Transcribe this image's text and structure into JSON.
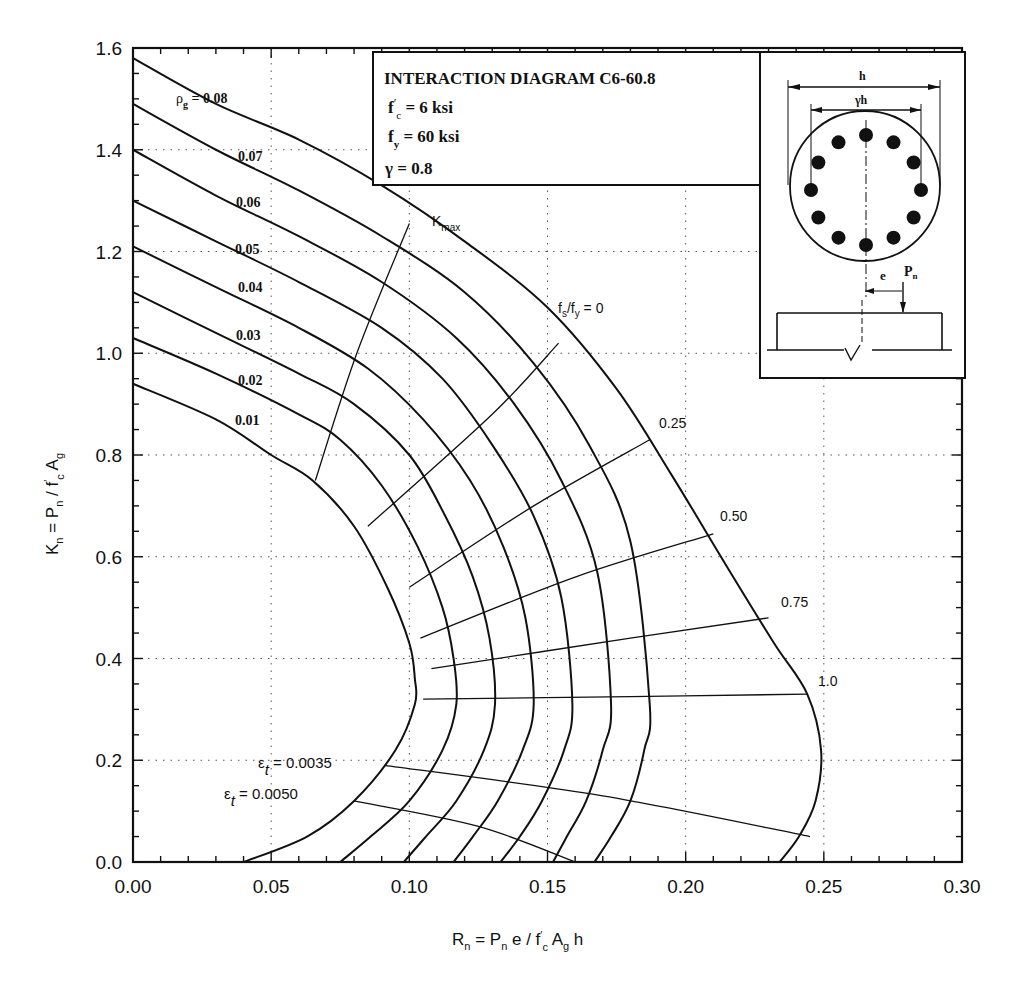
{
  "chart_data": {
    "type": "line",
    "title": "INTERACTION DIAGRAM C6-60.8",
    "parameters": [
      {
        "symbol": "f'c",
        "value": "6 ksi"
      },
      {
        "symbol": "fy",
        "value": "60 ksi"
      },
      {
        "symbol": "γ",
        "value": "0.8"
      }
    ],
    "xlabel": "Rn = Pn e / f'c Ag h",
    "ylabel": "Kn = Pn / f'c Ag",
    "xlim": [
      0.0,
      0.3
    ],
    "ylim": [
      0.0,
      1.6
    ],
    "xticks": [
      "0.00",
      "0.05",
      "0.10",
      "0.15",
      "0.20",
      "0.25",
      "0.30"
    ],
    "yticks": [
      "0.0",
      "0.2",
      "0.4",
      "0.6",
      "0.8",
      "1.0",
      "1.2",
      "1.4",
      "1.6"
    ],
    "grid": "dotted",
    "series": [
      {
        "name": "ρg = 0.01",
        "label": "0.01",
        "points": [
          [
            0.0,
            0.94
          ],
          [
            0.03,
            0.87
          ],
          [
            0.05,
            0.8
          ],
          [
            0.065,
            0.75
          ],
          [
            0.08,
            0.66
          ],
          [
            0.092,
            0.54
          ],
          [
            0.1,
            0.43
          ],
          [
            0.102,
            0.36
          ],
          [
            0.102,
            0.31
          ],
          [
            0.095,
            0.22
          ],
          [
            0.08,
            0.12
          ],
          [
            0.063,
            0.05
          ],
          [
            0.04,
            0.0
          ]
        ]
      },
      {
        "name": "ρg = 0.02",
        "label": "0.02",
        "points": [
          [
            0.0,
            1.03
          ],
          [
            0.03,
            0.96
          ],
          [
            0.06,
            0.88
          ],
          [
            0.075,
            0.83
          ],
          [
            0.09,
            0.74
          ],
          [
            0.103,
            0.62
          ],
          [
            0.112,
            0.5
          ],
          [
            0.116,
            0.4
          ],
          [
            0.117,
            0.31
          ],
          [
            0.112,
            0.22
          ],
          [
            0.1,
            0.12
          ],
          [
            0.086,
            0.05
          ],
          [
            0.075,
            0.0
          ]
        ]
      },
      {
        "name": "ρg = 0.03",
        "label": "0.03",
        "points": [
          [
            0.0,
            1.12
          ],
          [
            0.03,
            1.04
          ],
          [
            0.06,
            0.96
          ],
          [
            0.08,
            0.9
          ],
          [
            0.1,
            0.8
          ],
          [
            0.113,
            0.68
          ],
          [
            0.123,
            0.56
          ],
          [
            0.129,
            0.44
          ],
          [
            0.131,
            0.31
          ],
          [
            0.127,
            0.22
          ],
          [
            0.117,
            0.12
          ],
          [
            0.106,
            0.05
          ],
          [
            0.098,
            0.0
          ]
        ]
      },
      {
        "name": "ρg = 0.04",
        "label": "0.04",
        "points": [
          [
            0.0,
            1.21
          ],
          [
            0.03,
            1.13
          ],
          [
            0.06,
            1.05
          ],
          [
            0.085,
            0.97
          ],
          [
            0.105,
            0.87
          ],
          [
            0.122,
            0.75
          ],
          [
            0.134,
            0.62
          ],
          [
            0.142,
            0.48
          ],
          [
            0.145,
            0.31
          ],
          [
            0.141,
            0.22
          ],
          [
            0.132,
            0.12
          ],
          [
            0.123,
            0.05
          ],
          [
            0.116,
            0.0
          ]
        ]
      },
      {
        "name": "ρg = 0.05",
        "label": "0.05",
        "points": [
          [
            0.0,
            1.3
          ],
          [
            0.03,
            1.22
          ],
          [
            0.06,
            1.14
          ],
          [
            0.09,
            1.05
          ],
          [
            0.112,
            0.95
          ],
          [
            0.13,
            0.82
          ],
          [
            0.145,
            0.68
          ],
          [
            0.155,
            0.52
          ],
          [
            0.159,
            0.31
          ],
          [
            0.156,
            0.22
          ],
          [
            0.148,
            0.12
          ],
          [
            0.14,
            0.05
          ],
          [
            0.133,
            0.0
          ]
        ]
      },
      {
        "name": "ρg = 0.06",
        "label": "0.06",
        "points": [
          [
            0.0,
            1.4
          ],
          [
            0.03,
            1.31
          ],
          [
            0.06,
            1.23
          ],
          [
            0.09,
            1.14
          ],
          [
            0.117,
            1.03
          ],
          [
            0.138,
            0.9
          ],
          [
            0.155,
            0.75
          ],
          [
            0.168,
            0.57
          ],
          [
            0.173,
            0.31
          ],
          [
            0.17,
            0.22
          ],
          [
            0.164,
            0.12
          ],
          [
            0.157,
            0.05
          ],
          [
            0.152,
            0.0
          ]
        ]
      },
      {
        "name": "ρg = 0.07",
        "label": "0.07",
        "points": [
          [
            0.0,
            1.49
          ],
          [
            0.03,
            1.4
          ],
          [
            0.06,
            1.32
          ],
          [
            0.09,
            1.23
          ],
          [
            0.12,
            1.12
          ],
          [
            0.145,
            0.98
          ],
          [
            0.165,
            0.82
          ],
          [
            0.18,
            0.63
          ],
          [
            0.187,
            0.31
          ],
          [
            0.185,
            0.22
          ],
          [
            0.18,
            0.12
          ],
          [
            0.173,
            0.05
          ],
          [
            0.167,
            0.0
          ]
        ]
      },
      {
        "name": "ρg = 0.08",
        "label": "ρg = 0.08",
        "points": [
          [
            0.0,
            1.58
          ],
          [
            0.03,
            1.49
          ],
          [
            0.06,
            1.42
          ],
          [
            0.09,
            1.33
          ],
          [
            0.12,
            1.22
          ],
          [
            0.15,
            1.09
          ],
          [
            0.175,
            0.93
          ],
          [
            0.195,
            0.76
          ],
          [
            0.215,
            0.58
          ],
          [
            0.232,
            0.43
          ],
          [
            0.244,
            0.33
          ],
          [
            0.249,
            0.22
          ],
          [
            0.247,
            0.12
          ],
          [
            0.241,
            0.05
          ],
          [
            0.234,
            0.0
          ]
        ]
      }
    ],
    "fs_fy_lines": [
      {
        "label": "Kmax",
        "points": [
          [
            0.066,
            0.75
          ],
          [
            0.081,
            1.0
          ],
          [
            0.1,
            1.255
          ]
        ]
      },
      {
        "label": "fs/fy = 0",
        "points": [
          [
            0.085,
            0.66
          ],
          [
            0.13,
            0.88
          ],
          [
            0.154,
            1.02
          ]
        ]
      },
      {
        "label": "0.25",
        "points": [
          [
            0.1,
            0.54
          ],
          [
            0.145,
            0.7
          ],
          [
            0.187,
            0.83
          ]
        ]
      },
      {
        "label": "0.50",
        "points": [
          [
            0.104,
            0.44
          ],
          [
            0.16,
            0.56
          ],
          [
            0.21,
            0.645
          ]
        ]
      },
      {
        "label": "0.75",
        "points": [
          [
            0.108,
            0.38
          ],
          [
            0.18,
            0.44
          ],
          [
            0.23,
            0.48
          ]
        ]
      },
      {
        "label": "1.0",
        "points": [
          [
            0.105,
            0.32
          ],
          [
            0.18,
            0.325
          ],
          [
            0.244,
            0.33
          ]
        ]
      }
    ],
    "strain_lines": [
      {
        "label": "εt = 0.0035",
        "points": [
          [
            0.091,
            0.19
          ],
          [
            0.17,
            0.13
          ],
          [
            0.245,
            0.05
          ]
        ]
      },
      {
        "label": "εt = 0.0050",
        "points": [
          [
            0.08,
            0.12
          ],
          [
            0.125,
            0.07
          ],
          [
            0.16,
            0.0
          ]
        ]
      }
    ],
    "annotations": [
      "Kmax",
      "fs/fy = 0",
      "0.25",
      "0.50",
      "0.75",
      "1.0",
      "εt = 0.0035",
      "εt = 0.0050"
    ]
  },
  "labels": {
    "title": "INTERACTION DIAGRAM C6-60.8",
    "fc": "f′c = 6 ksi",
    "fc_main": "f",
    "fc_prime": "′",
    "fc_sub": "c",
    "fc_rest": " = 6 ksi",
    "fy_main": "f",
    "fy_sub": "y",
    "fy_rest": " = 60 ksi",
    "gamma": "γ = 0.8",
    "kmax_main": "K",
    "kmax_sub": "max",
    "fsfy_a": "f",
    "fsfy_s": "s",
    "fsfy_b": "/f",
    "fsfy_y": "y",
    "fsfy_rest": " = 0",
    "fs025": "0.25",
    "fs050": "0.50",
    "fs075": "0.75",
    "fs100": "1.0",
    "eps1_main": "ε",
    "eps1_sub": "t",
    "eps1_rest": " = 0.0035",
    "eps2_main": "ε",
    "eps2_sub": "t",
    "eps2_rest": " = 0.0050",
    "rho_main": "ρ",
    "rho_sub": "g",
    "rho_rest": " = 0.08",
    "rho07": "0.07",
    "rho06": "0.06",
    "rho05": "0.05",
    "rho04": "0.04",
    "rho03": "0.03",
    "rho02": "0.02",
    "rho01": "0.01",
    "sketch_h": "h",
    "sketch_gh": "γh",
    "sketch_e": "e",
    "sketch_p": "P",
    "sketch_pn_sub": "n"
  }
}
